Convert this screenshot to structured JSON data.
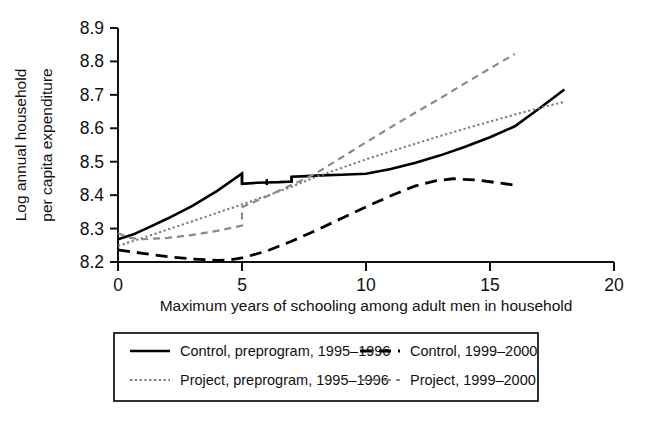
{
  "chart_data": {
    "type": "line",
    "title": "",
    "xlabel": "Maximum years of schooling among adult men in household",
    "ylabel": "Log annual household per capita expenditure",
    "xlim": [
      0,
      20
    ],
    "ylim": [
      8.15,
      8.93
    ],
    "xticks": [
      0,
      5,
      10,
      15,
      20
    ],
    "xtick_labels": [
      "0",
      "5",
      "10",
      "15",
      "20"
    ],
    "yticks": [
      8.2,
      8.3,
      8.4,
      8.5,
      8.6,
      8.7,
      8.8,
      8.9
    ],
    "ytick_labels": [
      "8.2",
      "8.3",
      "8.4",
      "8.5",
      "8.6",
      "8.7",
      "8.8",
      "8.9"
    ],
    "grid": false,
    "legend_position": "below-plot",
    "series": [
      {
        "name": "Control, preprogram, 1995–1996",
        "style": "solid",
        "color": "#000000",
        "width": 2.6,
        "x": [
          0,
          0.6,
          1.2,
          2.0,
          3.0,
          4.0,
          5.0,
          5.0,
          5.6,
          6.0,
          6.5,
          7.0,
          7.0,
          7.6,
          8.2,
          9.0,
          10.0,
          11.0,
          12.0,
          13.0,
          14.0,
          15.0,
          16.0,
          17.0,
          18.0
        ],
        "y": [
          8.268,
          8.282,
          8.302,
          8.33,
          8.368,
          8.413,
          8.465,
          8.434,
          8.437,
          8.438,
          8.439,
          8.441,
          8.455,
          8.457,
          8.459,
          8.461,
          8.464,
          8.478,
          8.497,
          8.519,
          8.545,
          8.573,
          8.606,
          8.66,
          8.716
        ]
      },
      {
        "name": "Control, 1999–2000",
        "style": "dashed",
        "color": "#000000",
        "width": 2.8,
        "x": [
          0,
          1.0,
          2.0,
          3.0,
          4.0,
          4.5,
          5.0,
          6.0,
          7.0,
          8.0,
          9.0,
          10.0,
          11.0,
          12.0,
          12.8,
          13.5,
          14.5,
          15.5,
          16.0
        ],
        "y": [
          8.236,
          8.226,
          8.216,
          8.209,
          8.205,
          8.206,
          8.212,
          8.233,
          8.262,
          8.295,
          8.33,
          8.365,
          8.398,
          8.428,
          8.443,
          8.449,
          8.445,
          8.435,
          8.43
        ]
      },
      {
        "name": "Project, preprogram, 1995–1996",
        "style": "dotted",
        "color": "#7a7a7a",
        "width": 2.0,
        "x": [
          0,
          1.0,
          2.0,
          3.0,
          4.0,
          5.0,
          6.0,
          7.0,
          8.0,
          9.0,
          10.0,
          11.0,
          12.0,
          13.0,
          14.0,
          15.0,
          16.0,
          17.0,
          18.0
        ],
        "y": [
          8.248,
          8.272,
          8.297,
          8.322,
          8.347,
          8.372,
          8.398,
          8.425,
          8.455,
          8.481,
          8.507,
          8.531,
          8.554,
          8.577,
          8.599,
          8.62,
          8.641,
          8.661,
          8.679
        ]
      },
      {
        "name": "Project, 1999–2000",
        "style": "dashed-light",
        "color": "#8a8a8a",
        "width": 2.2,
        "x": [
          0,
          0.5,
          1.0,
          2.0,
          3.0,
          4.0,
          5.0,
          5.0,
          5.6,
          6.2,
          6.8,
          7.4,
          8.0,
          9.0,
          10.0,
          11.0,
          12.0,
          13.0,
          14.0,
          15.0,
          16.0
        ],
        "y": [
          8.286,
          8.272,
          8.268,
          8.272,
          8.281,
          8.293,
          8.309,
          8.364,
          8.383,
          8.403,
          8.424,
          8.444,
          8.466,
          8.512,
          8.558,
          8.603,
          8.647,
          8.69,
          8.735,
          8.779,
          8.822
        ]
      }
    ]
  },
  "legend": {
    "entries": [
      {
        "label": "Control, preprogram, 1995–1996",
        "style": "solid"
      },
      {
        "label": "Control, 1999–2000",
        "style": "dashed"
      },
      {
        "label": "Project, preprogram, 1995–1996",
        "style": "dotted"
      },
      {
        "label": "Project, 1999–2000",
        "style": "dashed-light"
      }
    ]
  }
}
